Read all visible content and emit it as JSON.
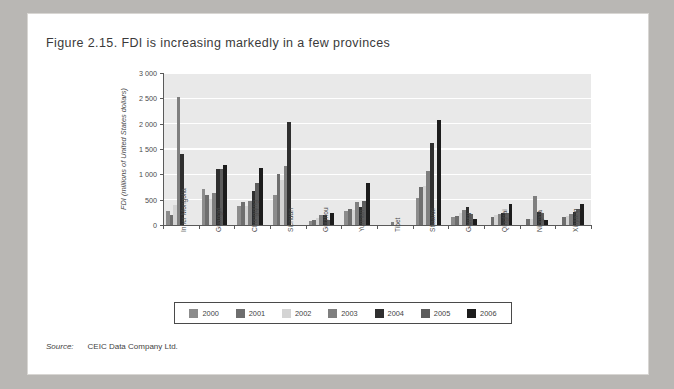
{
  "page": {
    "title": "Figure 2.15. FDI is increasing markedly in a few provinces",
    "source_label": "Source:",
    "source_text": "CEIC Data Company Ltd."
  },
  "chart_data": {
    "type": "bar",
    "title": "Figure 2.15. FDI is increasing markedly in a few provinces",
    "xlabel": "",
    "ylabel": "FDI (millions of United States dollars)",
    "ylim": [
      0,
      3000
    ],
    "ytick_labels": [
      "0",
      "500",
      "1 000",
      "1 500",
      "2 000",
      "2 500",
      "3 000"
    ],
    "yticks": [
      0,
      500,
      1000,
      1500,
      2000,
      2500,
      3000
    ],
    "grid": true,
    "legend_position": "bottom",
    "categories": [
      "Inner Mongolia",
      "Guangxi",
      "Chongqing",
      "Sichuan",
      "Guizhou",
      "Yunnan",
      "Tibet",
      "Shaanxi",
      "Gansu",
      "Qinghai",
      "Ningxia",
      "Xinjiang"
    ],
    "series": [
      {
        "name": "2000",
        "color": "#8c8c8c",
        "values": [
          275,
          715,
          375,
          600,
          80,
          275,
          5,
          530,
          165,
          0,
          0,
          0
        ]
      },
      {
        "name": "2001",
        "color": "#6e6e6e",
        "values": [
          205,
          590,
          455,
          1000,
          100,
          310,
          5,
          755,
          180,
          165,
          120,
          155
        ]
      },
      {
        "name": "2002",
        "color": "#d4d4d4",
        "values": [
          390,
          505,
          385,
          880,
          135,
          305,
          0,
          775,
          235,
          205,
          120,
          170
        ]
      },
      {
        "name": "2003",
        "color": "#7f7f7f",
        "values": [
          2525,
          640,
          465,
          1170,
          205,
          455,
          55,
          1075,
          295,
          225,
          575,
          215
        ]
      },
      {
        "name": "2004",
        "color": "#2f2f2f",
        "values": [
          1395,
          1105,
          670,
          2025,
          190,
          350,
          0,
          1615,
          355,
          230,
          255,
          250
        ]
      },
      {
        "name": "2005",
        "color": "#5c5c5c",
        "values": [
          0,
          1105,
          825,
          0,
          95,
          465,
          0,
          0,
          215,
          240,
          230,
          315
        ]
      },
      {
        "name": "2006",
        "color": "#1c1c1c",
        "values": [
          0,
          1180,
          1130,
          0,
          245,
          820,
          0,
          2065,
          120,
          405,
          105,
          405
        ]
      }
    ]
  },
  "legend": {
    "items": [
      {
        "label": "2000",
        "color": "#8c8c8c"
      },
      {
        "label": "2001",
        "color": "#6e6e6e"
      },
      {
        "label": "2002",
        "color": "#d4d4d4"
      },
      {
        "label": "2003",
        "color": "#7f7f7f"
      },
      {
        "label": "2004",
        "color": "#2f2f2f"
      },
      {
        "label": "2005",
        "color": "#5c5c5c"
      },
      {
        "label": "2006",
        "color": "#1c1c1c"
      }
    ]
  }
}
